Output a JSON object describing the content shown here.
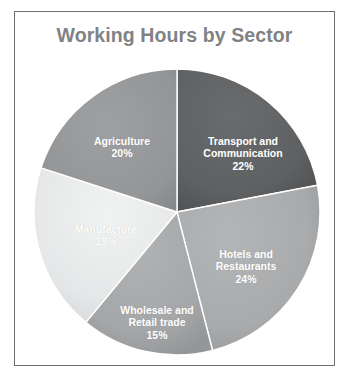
{
  "chart_data": {
    "type": "pie",
    "title": "Working Hours by Sector",
    "xlabel": "",
    "ylabel": "",
    "legend": "none",
    "grid": false,
    "labels_inside": true,
    "start_angle_deg": 0,
    "direction": "clockwise",
    "categories": [
      "Transport and Communication",
      "Hotels and Restaurants",
      "Wholesale and Retail trade",
      "Manufacture",
      "Agriculture"
    ],
    "values": [
      22,
      24,
      15,
      19,
      20
    ],
    "unit": "%",
    "slices": [
      {
        "name": "Transport and Communication",
        "label": "Transport and\nCommunication",
        "value": 22,
        "value_text": "22%",
        "color": "#5f6062"
      },
      {
        "name": "Hotels and Restaurants",
        "label": "Hotels and\nRestaurants",
        "value": 24,
        "value_text": "24%",
        "color": "#a9aaac"
      },
      {
        "name": "Wholesale and Retail trade",
        "label": "Wholesale and\nRetail trade",
        "value": 15,
        "value_text": "15%",
        "color": "#a5a6a8"
      },
      {
        "name": "Manufacture",
        "label": "Manufacture",
        "value": 19,
        "value_text": "19%",
        "color": "#e6e7e8"
      },
      {
        "name": "Agriculture",
        "label": "Agriculture",
        "value": 20,
        "value_text": "20%",
        "color": "#949597"
      }
    ]
  },
  "frame": {
    "border_color": "#6e6f71",
    "background": "#ffffff"
  },
  "title_color": "#808285"
}
